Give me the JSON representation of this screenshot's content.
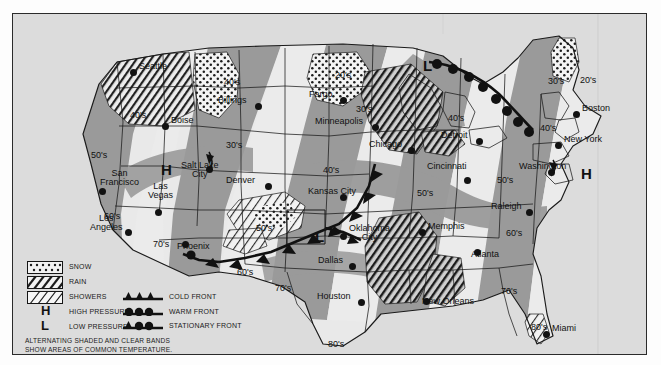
{
  "map": {
    "title": "US National Weather Map",
    "background_color": "#dcdcdc",
    "band_shade_color": "#9a9a9a",
    "band_clear_color": "#e9e9e9",
    "line_color": "#1a1a1a"
  },
  "cities": [
    {
      "name": "Seattle",
      "x": 120,
      "y": 58,
      "dx": 6,
      "dy": -4,
      "anchor": "left"
    },
    {
      "name": "Boise",
      "x": 152,
      "y": 112,
      "dx": 6,
      "dy": -4,
      "anchor": "left"
    },
    {
      "name": "Billings",
      "x": 245,
      "y": 92,
      "dx": -40,
      "dy": -4,
      "anchor": "left"
    },
    {
      "name": "San\nFrancisco",
      "x": 89,
      "y": 177,
      "dx": -2,
      "dy": -16,
      "anchor": "left"
    },
    {
      "name": "Las\nVegas",
      "x": 145,
      "y": 198,
      "dx": -10,
      "dy": -24,
      "anchor": "left"
    },
    {
      "name": "Los\nAngeles",
      "x": 115,
      "y": 218,
      "dx": -38,
      "dy": -12,
      "anchor": "left"
    },
    {
      "name": "Phoenix",
      "x": 172,
      "y": 230,
      "dx": -8,
      "dy": 4,
      "anchor": "left"
    },
    {
      "name": "Salt Lake\nCity",
      "x": 196,
      "y": 155,
      "dx": -28,
      "dy": -2,
      "anchor": "left"
    },
    {
      "name": "Denver",
      "x": 255,
      "y": 172,
      "dx": -42,
      "dy": -4,
      "anchor": "left"
    },
    {
      "name": "Fargo",
      "x": 330,
      "y": 86,
      "dx": -34,
      "dy": -4,
      "anchor": "left"
    },
    {
      "name": "Minneapolis",
      "x": 362,
      "y": 113,
      "dx": -60,
      "dy": -4,
      "anchor": "left"
    },
    {
      "name": "Kansas City",
      "x": 330,
      "y": 183,
      "dx": -35,
      "dy": -4,
      "anchor": "left"
    },
    {
      "name": "Chicago",
      "x": 398,
      "y": 136,
      "dx": -42,
      "dy": -4,
      "anchor": "left"
    },
    {
      "name": "Detroit",
      "x": 466,
      "y": 127,
      "dx": -38,
      "dy": -4,
      "anchor": "left"
    },
    {
      "name": "Cincinnati",
      "x": 454,
      "y": 166,
      "dx": -40,
      "dy": -12,
      "anchor": "left"
    },
    {
      "name": "Oklahoma\nCity",
      "x": 330,
      "y": 222,
      "dx": 6,
      "dy": -6,
      "anchor": "left"
    },
    {
      "name": "Dallas",
      "x": 339,
      "y": 252,
      "dx": -34,
      "dy": -4,
      "anchor": "left"
    },
    {
      "name": "Houston",
      "x": 348,
      "y": 288,
      "dx": -44,
      "dy": -4,
      "anchor": "left"
    },
    {
      "name": "Memphis",
      "x": 409,
      "y": 218,
      "dx": 6,
      "dy": -4,
      "anchor": "left"
    },
    {
      "name": "New Orleans",
      "x": 413,
      "y": 287,
      "dx": -4,
      "dy": 2,
      "anchor": "left"
    },
    {
      "name": "Atlanta",
      "x": 464,
      "y": 238,
      "dx": -6,
      "dy": 4,
      "anchor": "left"
    },
    {
      "name": "Raleigh",
      "x": 516,
      "y": 198,
      "dx": -38,
      "dy": -4,
      "anchor": "left"
    },
    {
      "name": "Washington",
      "x": 538,
      "y": 158,
      "dx": -32,
      "dy": -4,
      "anchor": "left"
    },
    {
      "name": "New York",
      "x": 545,
      "y": 131,
      "dx": 6,
      "dy": -4,
      "anchor": "left"
    },
    {
      "name": "Boston",
      "x": 563,
      "y": 100,
      "dx": 6,
      "dy": -4,
      "anchor": "left"
    },
    {
      "name": "Miami",
      "x": 533,
      "y": 320,
      "dx": 6,
      "dy": -4,
      "anchor": "left"
    }
  ],
  "temperatures": [
    {
      "value": "40's",
      "x": 211,
      "y": 64
    },
    {
      "value": "40's",
      "x": 117,
      "y": 97
    },
    {
      "value": "30's",
      "x": 213,
      "y": 127
    },
    {
      "value": "50's",
      "x": 78,
      "y": 137
    },
    {
      "value": "60's",
      "x": 91,
      "y": 198
    },
    {
      "value": "70's",
      "x": 140,
      "y": 226
    },
    {
      "value": "70's",
      "x": 262,
      "y": 270
    },
    {
      "value": "60's",
      "x": 224,
      "y": 254
    },
    {
      "value": "50's",
      "x": 243,
      "y": 210
    },
    {
      "value": "40's",
      "x": 310,
      "y": 152
    },
    {
      "value": "20's",
      "x": 322,
      "y": 57
    },
    {
      "value": "30's",
      "x": 343,
      "y": 91
    },
    {
      "value": "40's",
      "x": 435,
      "y": 100
    },
    {
      "value": "50's",
      "x": 404,
      "y": 175
    },
    {
      "value": "50's",
      "x": 484,
      "y": 162
    },
    {
      "value": "60's",
      "x": 493,
      "y": 215
    },
    {
      "value": "70's",
      "x": 488,
      "y": 273
    },
    {
      "value": "80's",
      "x": 315,
      "y": 326
    },
    {
      "value": "80's",
      "x": 518,
      "y": 309
    },
    {
      "value": "30's",
      "x": 535,
      "y": 63
    },
    {
      "value": "40's",
      "x": 527,
      "y": 110
    },
    {
      "value": "20's",
      "x": 567,
      "y": 62
    }
  ],
  "pressure_markers": [
    {
      "symbol": "H",
      "x": 148,
      "y": 148,
      "label": "high-pressure-west"
    },
    {
      "symbol": "L",
      "x": 410,
      "y": 44,
      "label": "low-pressure-north"
    },
    {
      "symbol": "L",
      "x": 302,
      "y": 215,
      "label": "low-pressure-plains"
    },
    {
      "symbol": "H",
      "x": 568,
      "y": 152,
      "label": "high-pressure-east"
    }
  ],
  "legend": {
    "items": [
      {
        "key": "snow",
        "label": "SNOW",
        "pattern": "dots"
      },
      {
        "key": "rain",
        "label": "RAIN",
        "pattern": "dense-hatch"
      },
      {
        "key": "showers",
        "label": "SHOWERS",
        "pattern": "sparse-hatch"
      },
      {
        "key": "high",
        "label": "HIGH PRESSURE",
        "symbol": "H"
      },
      {
        "key": "low",
        "label": "LOW PRESSURE",
        "symbol": "L"
      }
    ],
    "fronts": [
      {
        "key": "cold",
        "label": "COLD FRONT"
      },
      {
        "key": "warm",
        "label": "WARM FRONT"
      },
      {
        "key": "stationary",
        "label": "STATIONARY FRONT"
      }
    ],
    "note_line1": "ALTERNATING SHADED AND CLEAR BANDS",
    "note_line2": "SHOW AREAS OF COMMON TEMPERATURE."
  }
}
